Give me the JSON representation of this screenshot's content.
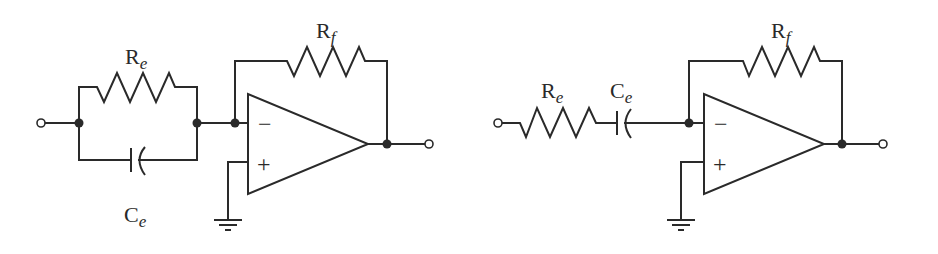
{
  "figure": {
    "left_circuit": {
      "description": "Inverting amplifier with parallel R_e || C_e input network",
      "labels": {
        "re_main": "R",
        "re_sub": "e",
        "ce_main": "C",
        "ce_sub": "e",
        "rf_main": "R",
        "rf_sub": "f"
      },
      "opamp": {
        "inverting_sign": "−",
        "noninverting_sign": "+"
      }
    },
    "right_circuit": {
      "description": "Inverting amplifier with series R_e – C_e input network",
      "labels": {
        "re_main": "R",
        "re_sub": "e",
        "ce_main": "C",
        "ce_sub": "e",
        "rf_main": "R",
        "rf_sub": "f"
      },
      "opamp": {
        "inverting_sign": "−",
        "noninverting_sign": "+"
      }
    },
    "colors": {
      "line": "#2a2a2a",
      "background": "#ffffff"
    }
  }
}
